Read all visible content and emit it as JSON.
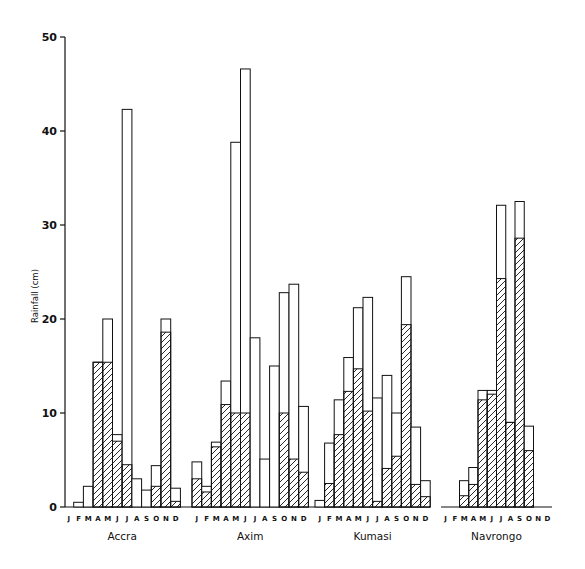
{
  "chart_data": {
    "type": "bar",
    "title": "",
    "xlabel": "",
    "ylabel": "Rainfall (cm)",
    "ylim": [
      0,
      50
    ],
    "yticks": [
      0,
      10,
      20,
      30,
      40,
      50
    ],
    "grid": false,
    "legend": null,
    "months": [
      "J",
      "F",
      "M",
      "A",
      "M",
      "J",
      "J",
      "A",
      "S",
      "O",
      "N",
      "D"
    ],
    "stations": [
      {
        "name": "Accra",
        "total": [
          0,
          0.5,
          2.2,
          15.4,
          20.0,
          7.7,
          42.3,
          3.0,
          1.8,
          4.4,
          20.0,
          2.0
        ],
        "hatched": [
          0,
          0,
          0,
          15.4,
          15.4,
          7.0,
          4.5,
          0,
          0,
          2.2,
          18.6,
          0.6
        ]
      },
      {
        "name": "Axim",
        "total": [
          4.8,
          2.2,
          6.9,
          13.4,
          38.8,
          46.6,
          18.0,
          5.1,
          15.0,
          22.8,
          23.7,
          10.7
        ],
        "hatched": [
          3.0,
          1.6,
          6.4,
          10.9,
          10.0,
          10.0,
          0,
          0,
          0,
          10.0,
          5.1,
          3.7
        ]
      },
      {
        "name": "Kumasi",
        "total": [
          0.7,
          6.8,
          11.4,
          15.9,
          21.2,
          22.3,
          11.6,
          14.0,
          10.0,
          24.5,
          8.5,
          2.8
        ],
        "hatched": [
          0,
          2.5,
          7.7,
          12.3,
          14.7,
          10.2,
          0.6,
          4.1,
          5.4,
          19.4,
          2.4,
          1.1
        ]
      },
      {
        "name": "Navrongo",
        "total": [
          0,
          0,
          2.8,
          4.2,
          12.4,
          12.4,
          32.1,
          9.0,
          32.5,
          8.6,
          0,
          0
        ],
        "hatched": [
          0,
          0,
          1.2,
          2.4,
          11.4,
          12.0,
          24.3,
          9.0,
          28.6,
          6.0,
          0,
          0
        ]
      }
    ]
  },
  "layout": {
    "axis_x": 65,
    "y_zero": 507,
    "px_per_unit": 9.4,
    "groups": [
      {
        "x0": 64,
        "slot": 9.7
      },
      {
        "x0": 192,
        "slot": 9.7
      },
      {
        "x0": 315,
        "slot": 9.6
      },
      {
        "x0": 441,
        "slot": 9.25
      }
    ],
    "baselines": [
      [
        65,
        430
      ],
      [
        441,
        552
      ]
    ]
  }
}
